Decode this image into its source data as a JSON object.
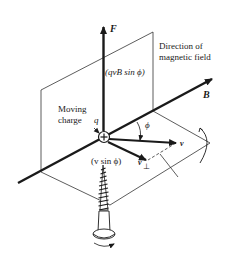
{
  "diagram": {
    "labels": {
      "force": "F",
      "force_magnitude": "(qvB sin ϕ)",
      "field_direction_line1": "Direction of",
      "field_direction_line2": "magnetic field",
      "field": "B",
      "moving_charge_line1": "Moving",
      "moving_charge_line2": "charge",
      "charge_symbol": "q",
      "angle": "ϕ",
      "velocity": "v",
      "v_perp": "v",
      "perp_subscript": "⊥",
      "v_perp_magnitude": "(v sin ϕ)",
      "charge_sign": "+"
    },
    "icons": [
      "screw-icon",
      "rotation-arrow-icon",
      "charge-plus-icon"
    ],
    "colors": {
      "ink": "#1a1a1a",
      "thin_line": "#333333",
      "background": "#ffffff"
    }
  }
}
